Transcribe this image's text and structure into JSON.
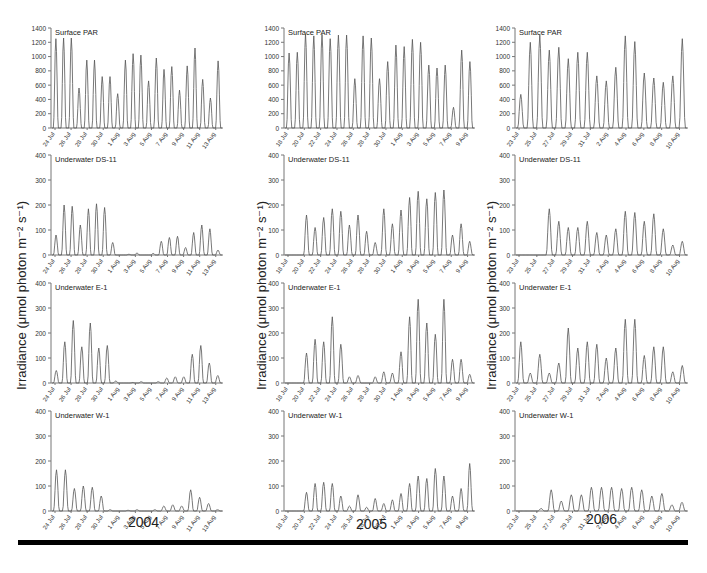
{
  "figure": {
    "ylabel": "Irradiance (μmol photon m⁻² s⁻¹)",
    "ylabel_parts": {
      "main": "Irradiance (μmol photon m",
      "sup1": "-2",
      "mid": " s",
      "sup2": "-1",
      "end": ")"
    },
    "columns": [
      {
        "year": "2004"
      },
      {
        "year": "2005"
      },
      {
        "year": "2006"
      }
    ],
    "line_color": "#555555",
    "axis_color": "#777777"
  },
  "chart_data": [
    {
      "type": "line",
      "year": "2004",
      "title": "Surface PAR",
      "ylim": [
        0,
        1400
      ],
      "yticks": [
        0,
        200,
        400,
        600,
        800,
        1000,
        1200,
        1400
      ],
      "xticks": [
        "24 Jul",
        "26 Jul",
        "28 Jul",
        "30 Jul",
        "1 Aug",
        "3 Aug",
        "5 Aug",
        "7 Aug",
        "9 Aug",
        "11 Aug",
        "13 Aug"
      ],
      "daily_peaks": [
        1250,
        1260,
        1260,
        560,
        950,
        950,
        720,
        720,
        480,
        950,
        1040,
        1020,
        660,
        980,
        820,
        860,
        530,
        870,
        1120,
        680,
        420,
        940
      ]
    },
    {
      "type": "line",
      "year": "2004",
      "title": "Underwater DS-11",
      "ylim": [
        0,
        400
      ],
      "yticks": [
        0,
        100,
        200,
        300,
        400
      ],
      "xticks": [
        "24 Jul",
        "26 Jul",
        "28 Jul",
        "30 Jul",
        "1 Aug",
        "3 Aug",
        "5 Aug",
        "7 Aug",
        "9 Aug",
        "11 Aug",
        "13 Aug"
      ],
      "daily_peaks": [
        80,
        200,
        195,
        120,
        185,
        205,
        190,
        50,
        0,
        3,
        8,
        0,
        6,
        55,
        70,
        75,
        30,
        90,
        120,
        105,
        20
      ]
    },
    {
      "type": "line",
      "year": "2004",
      "title": "Underwater E-1",
      "ylim": [
        0,
        400
      ],
      "yticks": [
        0,
        100,
        200,
        300,
        400
      ],
      "xticks": [
        "24 Jul",
        "26 Jul",
        "28 Jul",
        "30 Jul",
        "1 Aug",
        "3 Aug",
        "5 Aug",
        "7 Aug",
        "9 Aug",
        "11 Aug",
        "13 Aug"
      ],
      "daily_peaks": [
        50,
        165,
        250,
        145,
        240,
        140,
        150,
        8,
        0,
        2,
        5,
        0,
        5,
        20,
        25,
        25,
        115,
        150,
        80,
        30
      ]
    },
    {
      "type": "line",
      "year": "2004",
      "title": "Underwater W-1",
      "ylim": [
        0,
        400
      ],
      "yticks": [
        0,
        100,
        200,
        300,
        400
      ],
      "xticks": [
        "24 Jul",
        "26 Jul",
        "28 Jul",
        "30 Jul",
        "1 Aug",
        "3 Aug",
        "5 Aug",
        "7 Aug",
        "9 Aug",
        "11 Aug",
        "13 Aug"
      ],
      "daily_peaks": [
        165,
        165,
        90,
        100,
        95,
        60,
        5,
        0,
        3,
        5,
        0,
        5,
        20,
        25,
        20,
        85,
        55,
        30,
        5
      ]
    },
    {
      "type": "line",
      "year": "2005",
      "title": "Surface PAR",
      "ylim": [
        0,
        1400
      ],
      "yticks": [
        0,
        200,
        400,
        600,
        800,
        1000,
        1200,
        1400
      ],
      "xticks": [
        "18 Jul",
        "20 Jul",
        "22 Jul",
        "24 Jul",
        "26 Jul",
        "28 Jul",
        "30 Jul",
        "1 Aug",
        "3 Aug",
        "5 Aug",
        "7 Aug",
        "9 Aug"
      ],
      "daily_peaks": [
        1050,
        1060,
        1320,
        1290,
        1310,
        1250,
        1300,
        1300,
        690,
        1290,
        1260,
        690,
        930,
        1160,
        1140,
        1240,
        1200,
        880,
        840,
        880,
        290,
        1090,
        930
      ]
    },
    {
      "type": "line",
      "year": "2005",
      "title": "Underwater DS-11",
      "ylim": [
        0,
        400
      ],
      "yticks": [
        0,
        100,
        200,
        300,
        400
      ],
      "xticks": [
        "18 Jul",
        "20 Jul",
        "22 Jul",
        "24 Jul",
        "26 Jul",
        "28 Jul",
        "30 Jul",
        "1 Aug",
        "3 Aug",
        "5 Aug",
        "7 Aug",
        "9 Aug"
      ],
      "daily_peaks": [
        0,
        0,
        160,
        110,
        150,
        185,
        175,
        120,
        160,
        95,
        50,
        185,
        125,
        180,
        230,
        255,
        225,
        250,
        260,
        80,
        125,
        55
      ]
    },
    {
      "type": "line",
      "year": "2005",
      "title": "Underwater E-1",
      "ylim": [
        0,
        400
      ],
      "yticks": [
        0,
        100,
        200,
        300,
        400
      ],
      "xticks": [
        "18 Jul",
        "20 Jul",
        "22 Jul",
        "24 Jul",
        "26 Jul",
        "28 Jul",
        "30 Jul",
        "1 Aug",
        "3 Aug",
        "5 Aug",
        "7 Aug",
        "9 Aug"
      ],
      "daily_peaks": [
        0,
        0,
        120,
        175,
        165,
        265,
        155,
        25,
        30,
        0,
        25,
        45,
        40,
        125,
        265,
        335,
        240,
        195,
        335,
        95,
        95,
        35
      ]
    },
    {
      "type": "line",
      "year": "2005",
      "title": "Underwater W-1",
      "ylim": [
        0,
        400
      ],
      "yticks": [
        0,
        100,
        200,
        300,
        400
      ],
      "xticks": [
        "18 Jul",
        "20 Jul",
        "22 Jul",
        "24 Jul",
        "26 Jul",
        "28 Jul",
        "30 Jul",
        "1 Aug",
        "3 Aug",
        "5 Aug",
        "7 Aug",
        "9 Aug"
      ],
      "daily_peaks": [
        0,
        0,
        75,
        110,
        115,
        110,
        60,
        20,
        65,
        15,
        50,
        30,
        45,
        70,
        110,
        140,
        130,
        170,
        140,
        60,
        90,
        190
      ]
    },
    {
      "type": "line",
      "year": "2006",
      "title": "Surface PAR",
      "ylim": [
        0,
        1400
      ],
      "yticks": [
        0,
        200,
        400,
        600,
        800,
        1000,
        1200,
        1400
      ],
      "xticks": [
        "23 Jul",
        "25 Jul",
        "27 Jul",
        "29 Jul",
        "31 Jul",
        "2 Aug",
        "4 Aug",
        "6 Aug",
        "8 Aug",
        "10 Aug"
      ],
      "daily_peaks": [
        470,
        1200,
        1300,
        1090,
        1130,
        970,
        1060,
        1060,
        730,
        660,
        850,
        1290,
        1210,
        770,
        700,
        640,
        730,
        1250
      ]
    },
    {
      "type": "line",
      "year": "2006",
      "title": "Underwater DS-11",
      "ylim": [
        0,
        400
      ],
      "yticks": [
        0,
        100,
        200,
        300,
        400
      ],
      "xticks": [
        "23 Jul",
        "25 Jul",
        "27 Jul",
        "29 Jul",
        "31 Jul",
        "2 Aug",
        "4 Aug",
        "6 Aug",
        "8 Aug",
        "10 Aug"
      ],
      "daily_peaks": [
        0,
        0,
        0,
        185,
        135,
        110,
        110,
        135,
        90,
        80,
        105,
        175,
        170,
        135,
        165,
        105,
        40,
        55
      ]
    },
    {
      "type": "line",
      "year": "2006",
      "title": "Underwater E-1",
      "ylim": [
        0,
        400
      ],
      "yticks": [
        0,
        100,
        200,
        300,
        400
      ],
      "xticks": [
        "23 Jul",
        "25 Jul",
        "27 Jul",
        "29 Jul",
        "31 Jul",
        "2 Aug",
        "4 Aug",
        "6 Aug",
        "8 Aug",
        "10 Aug"
      ],
      "daily_peaks": [
        165,
        40,
        115,
        40,
        80,
        220,
        140,
        165,
        155,
        100,
        140,
        255,
        255,
        110,
        145,
        145,
        45,
        70
      ]
    },
    {
      "type": "line",
      "year": "2006",
      "title": "Underwater W-1",
      "ylim": [
        0,
        400
      ],
      "yticks": [
        0,
        100,
        200,
        300,
        400
      ],
      "xticks": [
        "23 Jul",
        "25 Jul",
        "27 Jul",
        "29 Jul",
        "31 Jul",
        "2 Aug",
        "4 Aug",
        "6 Aug",
        "8 Aug",
        "10 Aug"
      ],
      "daily_peaks": [
        0,
        0,
        10,
        85,
        40,
        65,
        65,
        95,
        95,
        95,
        90,
        95,
        85,
        60,
        70,
        25,
        35
      ]
    }
  ]
}
